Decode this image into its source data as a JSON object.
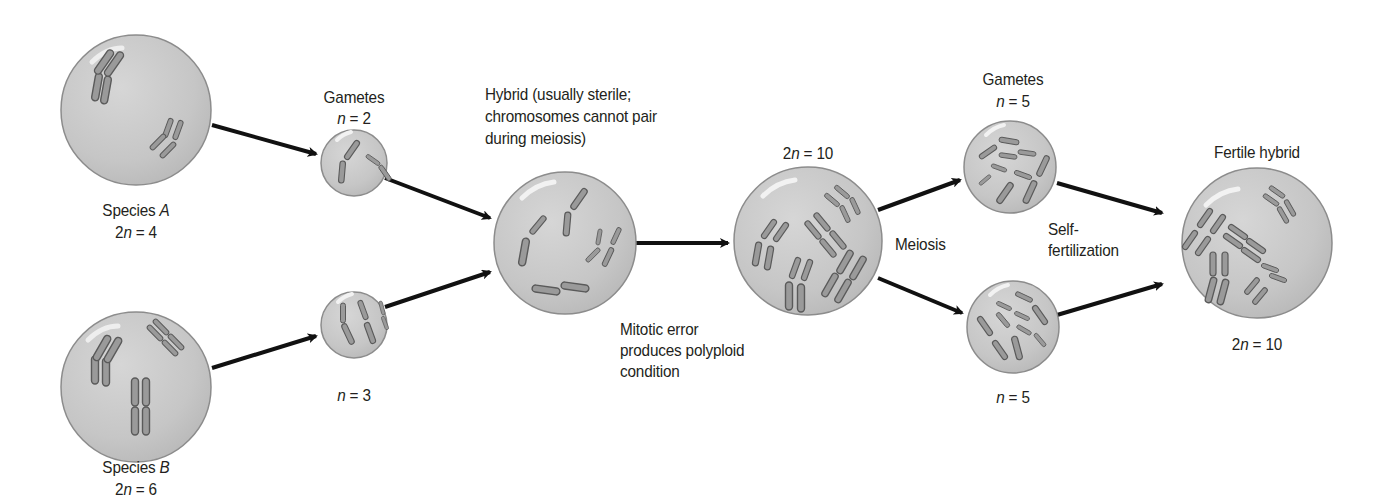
{
  "diagram": {
    "type": "flow",
    "topic": "Allopolyploid speciation",
    "colors": {
      "cell_fill": "#c9c9c9",
      "cell_edge": "#8c8c8c",
      "chromosome_fill": "#9a9a9a",
      "chromosome_edge": "#5a5a5a",
      "arrow": "#111111",
      "text": "#231f20"
    },
    "nodes": [
      {
        "id": "species_a",
        "title": "Species ",
        "title_italic": "A",
        "count_prefix": "2",
        "count_var": "n",
        "count_suffix": " = 4",
        "chromosomes": 4
      },
      {
        "id": "species_b",
        "title": "Species ",
        "title_italic": "B",
        "count_prefix": "2",
        "count_var": "n",
        "count_suffix": " = 6",
        "chromosomes": 6
      },
      {
        "id": "gametes_a",
        "title": "Gametes",
        "count_prefix": "",
        "count_var": "n",
        "count_suffix": " = 2",
        "chromosomes": 2
      },
      {
        "id": "gametes_b",
        "count_prefix": "",
        "count_var": "n",
        "count_suffix": " = 3",
        "chromosomes": 3
      },
      {
        "id": "hybrid",
        "title_lines": [
          "Hybrid (usually sterile;",
          "chromosomes cannot pair",
          "during meiosis)"
        ],
        "chromosomes": 5
      },
      {
        "id": "polyploid",
        "count_prefix": "2",
        "count_var": "n",
        "count_suffix": " = 10",
        "chromosomes": 10
      },
      {
        "id": "gametes_top",
        "title": "Gametes",
        "count_prefix": "",
        "count_var": "n",
        "count_suffix": " = 5",
        "chromosomes": 5
      },
      {
        "id": "gametes_bottom",
        "count_prefix": "",
        "count_var": "n",
        "count_suffix": " = 5",
        "chromosomes": 5
      },
      {
        "id": "fertile_hybrid",
        "title": "Fertile hybrid",
        "count_prefix": "2",
        "count_var": "n",
        "count_suffix": " = 10",
        "chromosomes": 10
      }
    ],
    "process_labels": {
      "mitotic_error": [
        "Mitotic error",
        "produces polyploid",
        "condition"
      ],
      "meiosis": "Meiosis",
      "self_fertilization": [
        "Self-",
        "fertilization"
      ]
    },
    "edges": [
      {
        "from": "species_a",
        "to": "gametes_a"
      },
      {
        "from": "species_b",
        "to": "gametes_b"
      },
      {
        "from": "gametes_a",
        "to": "hybrid"
      },
      {
        "from": "gametes_b",
        "to": "hybrid"
      },
      {
        "from": "hybrid",
        "to": "polyploid",
        "label": "Mitotic error produces polyploid condition"
      },
      {
        "from": "polyploid",
        "to": "gametes_top",
        "label": "Meiosis"
      },
      {
        "from": "polyploid",
        "to": "gametes_bottom",
        "label": "Meiosis"
      },
      {
        "from": "gametes_top",
        "to": "fertile_hybrid",
        "label": "Self-fertilization"
      },
      {
        "from": "gametes_bottom",
        "to": "fertile_hybrid",
        "label": "Self-fertilization"
      }
    ]
  }
}
